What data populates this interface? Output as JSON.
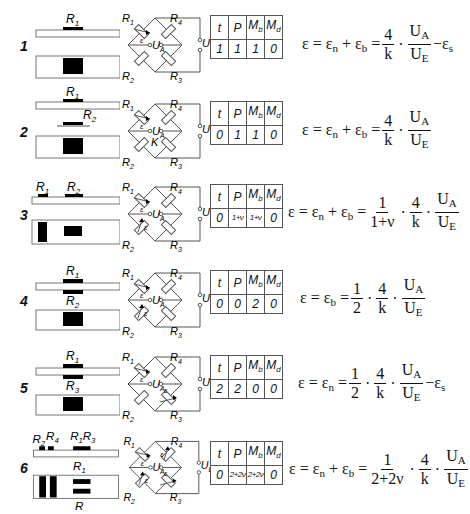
{
  "table_headers": [
    "t",
    "P",
    "Mb",
    "Md"
  ],
  "bridge_labels": {
    "r1": "R",
    "r1sub": "1",
    "r2": "R",
    "r2sub": "2",
    "r3": "R",
    "r3sub": "3",
    "r4": "R",
    "r4sub": "4",
    "ua": "U",
    "uasub": "A",
    "ue": "U",
    "uesub": "E",
    "eps": "ε",
    "k": "K"
  },
  "rows": [
    {
      "number": "1",
      "top_labels": [
        {
          "text": "R",
          "sub": "1"
        }
      ],
      "table_values": [
        "1",
        "1",
        "1",
        "0"
      ],
      "formula": {
        "lhs": "ε = ε",
        "parts": "n + ε b = 4/k · UA/UE − εs"
      },
      "formula_text": "ε = εn + εb = 4/k · UA/UE − εs"
    },
    {
      "number": "2",
      "top_labels": [
        {
          "text": "R",
          "sub": "1"
        },
        {
          "text": "R",
          "sub": "2"
        }
      ],
      "table_values": [
        "0",
        "1",
        "1",
        "0"
      ],
      "formula_text": "ε = εn + εb = 4/k · UA/UE"
    },
    {
      "number": "3",
      "top_labels": [
        {
          "text": "R",
          "sub": "1"
        },
        {
          "text": "R",
          "sub": "2"
        }
      ],
      "table_values": [
        "0",
        "1+ν",
        "1+ν",
        "0"
      ],
      "formula_text": "ε = εn + εb = 1/(1+ν) · 4/k · UA/UE"
    },
    {
      "number": "4",
      "top_labels": [
        {
          "text": "R",
          "sub": "1"
        },
        {
          "text": "R",
          "sub": "2"
        }
      ],
      "table_values": [
        "0",
        "0",
        "2",
        "0"
      ],
      "formula_text": "ε = εb = 1/2 · 4/k · UA/UE"
    },
    {
      "number": "5",
      "top_labels": [
        {
          "text": "R",
          "sub": "1"
        },
        {
          "text": "R",
          "sub": "3"
        }
      ],
      "table_values": [
        "2",
        "2",
        "0",
        "0"
      ],
      "formula_text": "ε = εn = 1/2 · 4/k · UA/UE − εs"
    },
    {
      "number": "6",
      "top_labels": [
        {
          "text": "R",
          "sub": "2"
        },
        {
          "text": "R",
          "sub": "4"
        },
        {
          "text": "R",
          "sub": "1"
        },
        {
          "text": "R",
          "sub": "3"
        },
        {
          "text": "R",
          "sub": "1"
        },
        {
          "text": "R",
          "sub": ""
        }
      ],
      "table_values": [
        "0",
        "2+2ν",
        "2+2ν",
        "0"
      ],
      "formula_text": "ε = εn + εb = 1/(2+2ν) · 4/k · UA/UE"
    }
  ],
  "formula_tokens": {
    "eps": "ε",
    "eq": "=",
    "plus": "+",
    "minus": "−",
    "dot": "·",
    "n": "n",
    "b": "b",
    "s": "s",
    "four": "4",
    "k": "k",
    "one": "1",
    "two": "2",
    "UA_U": "U",
    "UA_A": "A",
    "UE_U": "U",
    "UE_E": "E",
    "one_plus_nu": "1+ν",
    "two_plus_two_nu": "2+2ν"
  }
}
